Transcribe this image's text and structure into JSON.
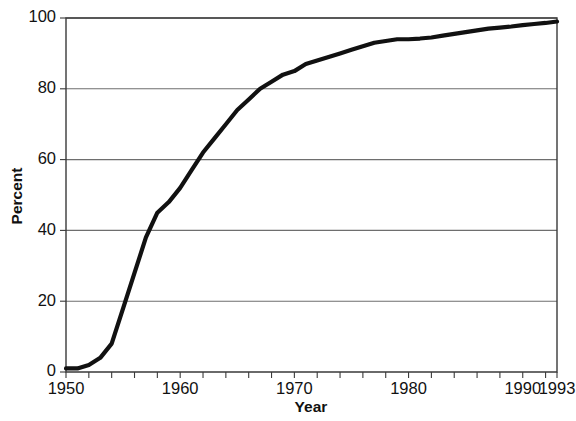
{
  "chart_data": {
    "type": "line",
    "title": "",
    "xlabel": "Year",
    "ylabel": "Percent",
    "xlim": [
      1950,
      1993
    ],
    "ylim": [
      0,
      100
    ],
    "grid": "horizontal",
    "legend": "none",
    "x_ticks_major": [
      1950,
      1960,
      1970,
      1980,
      1990,
      1993
    ],
    "x_tick_labels": [
      "1950",
      "1960",
      "1970",
      "1980",
      "1990",
      "1993"
    ],
    "x_tick_interval_minor": 2,
    "y_ticks": [
      0,
      20,
      40,
      60,
      80,
      100
    ],
    "y_tick_labels": [
      "0",
      "20",
      "40",
      "60",
      "80",
      "100"
    ],
    "series": [
      {
        "name": "Percent",
        "color": "#111111",
        "x": [
          1950,
          1951,
          1952,
          1953,
          1954,
          1955,
          1956,
          1957,
          1958,
          1959,
          1960,
          1961,
          1962,
          1963,
          1964,
          1965,
          1966,
          1967,
          1968,
          1969,
          1970,
          1971,
          1972,
          1973,
          1974,
          1975,
          1976,
          1977,
          1978,
          1979,
          1980,
          1981,
          1982,
          1983,
          1984,
          1985,
          1986,
          1987,
          1988,
          1989,
          1990,
          1991,
          1992,
          1993
        ],
        "values": [
          1,
          1,
          2,
          4,
          8,
          18,
          28,
          38,
          45,
          48,
          52,
          57,
          62,
          66,
          70,
          74,
          77,
          80,
          82,
          84,
          85,
          87,
          88,
          89,
          90,
          91,
          92,
          93,
          93.5,
          94,
          94,
          94.2,
          94.5,
          95,
          95.5,
          96,
          96.5,
          97,
          97.3,
          97.6,
          98,
          98.3,
          98.6,
          99
        ]
      }
    ]
  },
  "figure": {
    "plot_left": 66,
    "plot_right": 557,
    "plot_top": 18,
    "plot_bottom": 372
  }
}
